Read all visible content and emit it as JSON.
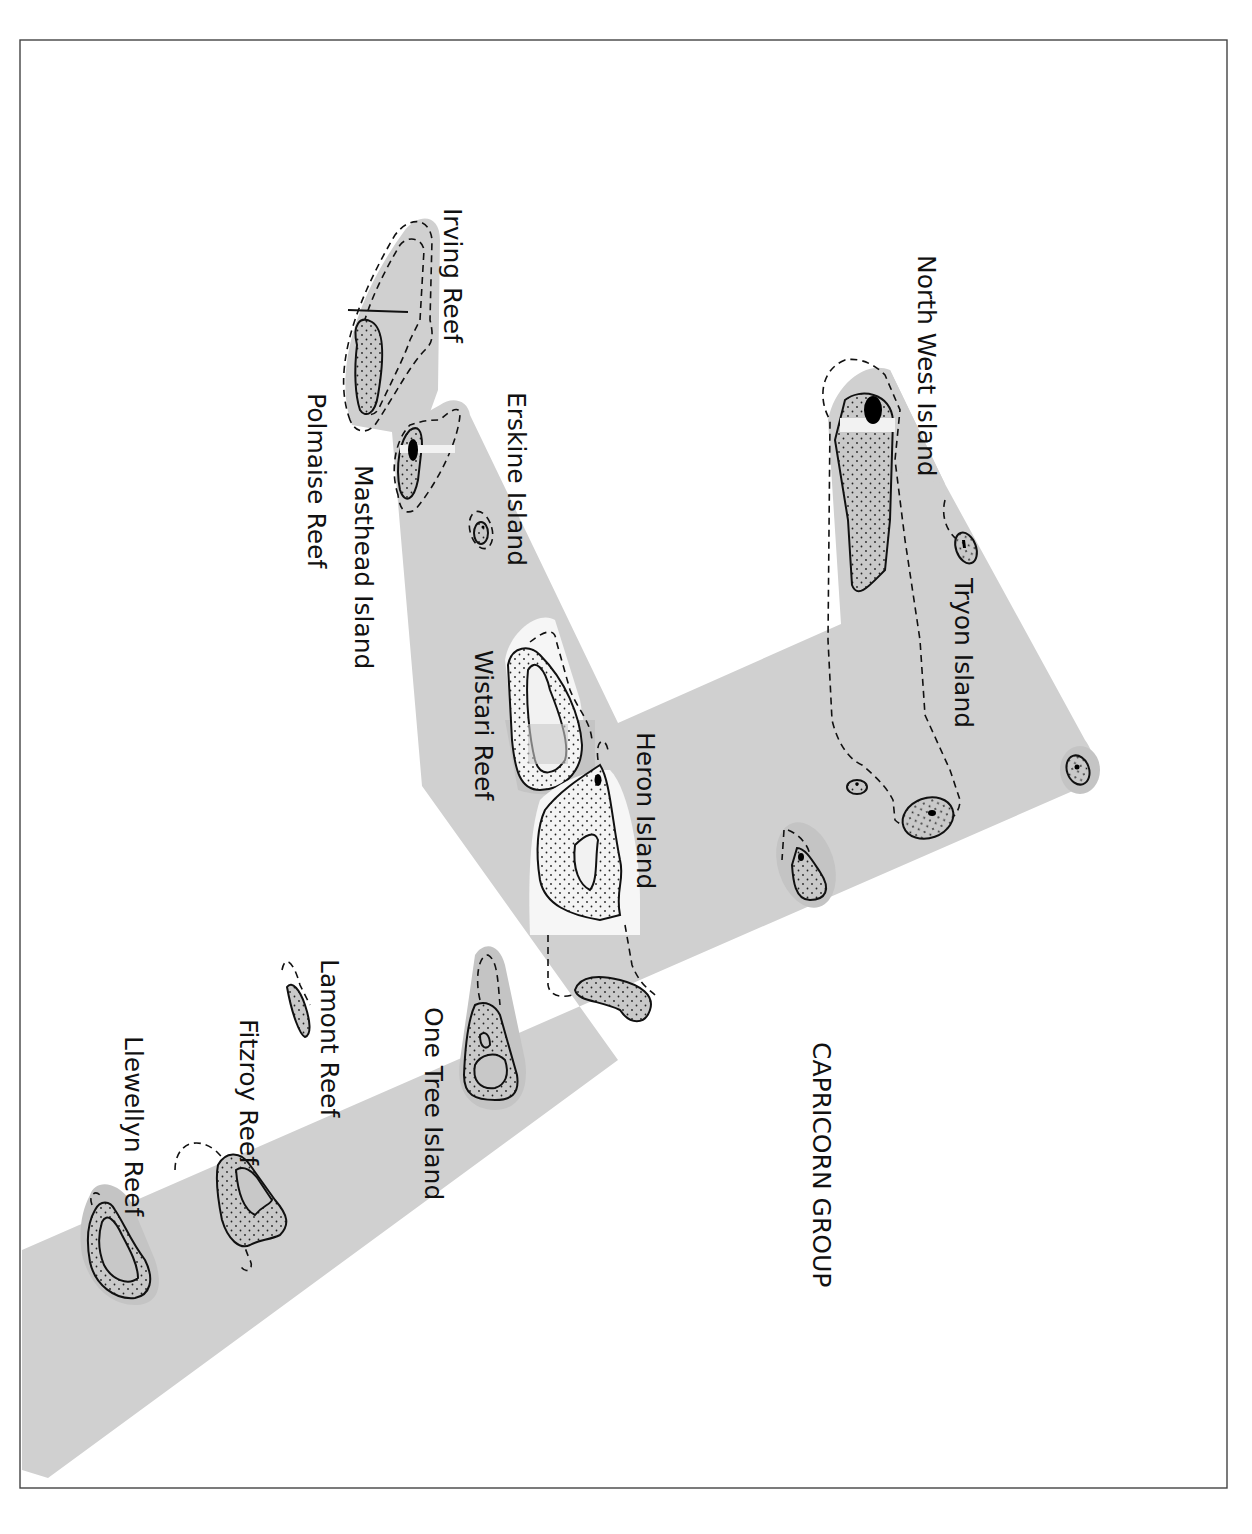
{
  "map": {
    "title": "CAPRICORN GROUP",
    "orientation": "rotated 90 degrees clockwise",
    "colors": {
      "zone_fill": "#d0d0d0",
      "reef_halo": "#c4c4c4",
      "highlight_fill": "#f6f6f6",
      "outline": "#111111",
      "frame": "#444444"
    },
    "legend_symbols": {
      "solid_outline": "reef edge",
      "dashed_outline": "reef flat / lagoon limit",
      "stipple": "reef flat",
      "black_fill": "island (cay)"
    },
    "labels": [
      {
        "id": "north-west-island",
        "text": "North West Island"
      },
      {
        "id": "tryon-island",
        "text": "Tryon Island"
      },
      {
        "id": "irving-reef",
        "text": "Irving Reef"
      },
      {
        "id": "erskine-island",
        "text": "Erskine Island"
      },
      {
        "id": "polmaise-reef",
        "text": "Polmaise Reef"
      },
      {
        "id": "masthead-island",
        "text": "Masthead Island"
      },
      {
        "id": "wistari-reef",
        "text": "Wistari Reef"
      },
      {
        "id": "heron-island",
        "text": "Heron Island"
      },
      {
        "id": "one-tree-island",
        "text": "One Tree Island"
      },
      {
        "id": "lamont-reef",
        "text": "Lamont Reef"
      },
      {
        "id": "fitzroy-reef",
        "text": "Fitzroy Reef"
      },
      {
        "id": "llewellyn-reef",
        "text": "Llewellyn Reef"
      },
      {
        "id": "capricorn-group",
        "text": "CAPRICORN GROUP"
      }
    ]
  }
}
